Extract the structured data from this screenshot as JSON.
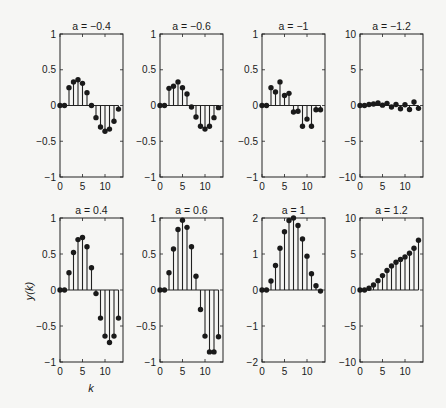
{
  "figure": {
    "ylabel": "y(k)",
    "xlabel": "k"
  },
  "chart_data": [
    {
      "type": "stem",
      "title": "a = −0.4",
      "row": 0,
      "col": 0,
      "xlim": [
        0,
        14
      ],
      "ylim": [
        -1,
        1
      ],
      "xticks": [
        0,
        5,
        10
      ],
      "yticks": [
        -1,
        -0.5,
        0,
        0.5,
        1
      ],
      "ytick_labels": [
        "−1",
        "−0.5",
        "0",
        "0.5",
        "1"
      ],
      "x": [
        0,
        1,
        2,
        3,
        4,
        5,
        6,
        7,
        8,
        9,
        10,
        11,
        12,
        13
      ],
      "values": [
        0,
        0,
        0.25,
        0.33,
        0.36,
        0.31,
        0.18,
        0,
        -0.17,
        -0.3,
        -0.36,
        -0.33,
        -0.22,
        -0.05
      ]
    },
    {
      "type": "stem",
      "title": "a = −0.6",
      "row": 0,
      "col": 1,
      "xlim": [
        0,
        14
      ],
      "ylim": [
        -1,
        1
      ],
      "xticks": [
        0,
        5,
        10
      ],
      "yticks": [
        -1,
        -0.5,
        0,
        0.5,
        1
      ],
      "ytick_labels": [
        "−1",
        "−0.5",
        "0",
        "0.5",
        "1"
      ],
      "x": [
        0,
        1,
        2,
        3,
        4,
        5,
        6,
        7,
        8,
        9,
        10,
        11,
        12,
        13
      ],
      "values": [
        0,
        0,
        0.24,
        0.27,
        0.33,
        0.25,
        0.16,
        -0.02,
        -0.16,
        -0.29,
        -0.33,
        -0.29,
        -0.17,
        -0.03
      ]
    },
    {
      "type": "stem",
      "title": "a = −1",
      "row": 0,
      "col": 2,
      "xlim": [
        0,
        14
      ],
      "ylim": [
        -1,
        1
      ],
      "xticks": [
        0,
        5,
        10
      ],
      "yticks": [
        -1,
        -0.5,
        0,
        0.5,
        1
      ],
      "ytick_labels": [
        "−1",
        "−0.5",
        "0",
        "0.5",
        "1"
      ],
      "x": [
        0,
        1,
        2,
        3,
        4,
        5,
        6,
        7,
        8,
        9,
        10,
        11,
        12,
        13
      ],
      "values": [
        0,
        0,
        0.25,
        0.19,
        0.33,
        0.14,
        0.17,
        -0.09,
        -0.08,
        -0.29,
        -0.19,
        -0.29,
        -0.06,
        -0.06
      ]
    },
    {
      "type": "stem",
      "title": "a = −1.2",
      "row": 0,
      "col": 3,
      "xlim": [
        0,
        14
      ],
      "ylim": [
        -10,
        10
      ],
      "xticks": [
        0,
        5,
        10
      ],
      "yticks": [
        -10,
        -5,
        0,
        5,
        10
      ],
      "ytick_labels": [
        "−10",
        "−5",
        "0",
        "5",
        "10"
      ],
      "x": [
        0,
        1,
        2,
        3,
        4,
        5,
        6,
        7,
        8,
        9,
        10,
        11,
        12,
        13
      ],
      "values": [
        0,
        0,
        0.15,
        0.2,
        0.35,
        0.05,
        0.3,
        -0.2,
        0.15,
        -0.45,
        0.1,
        -0.55,
        0.5,
        -0.4
      ]
    },
    {
      "type": "stem",
      "title": "a = 0.4",
      "row": 1,
      "col": 0,
      "xlim": [
        0,
        14
      ],
      "ylim": [
        -1,
        1
      ],
      "xticks": [
        0,
        5,
        10
      ],
      "yticks": [
        -1,
        -0.5,
        0,
        0.5,
        1
      ],
      "ytick_labels": [
        "−1",
        "−0.5",
        "0",
        "0.5",
        "1"
      ],
      "x": [
        0,
        1,
        2,
        3,
        4,
        5,
        6,
        7,
        8,
        9,
        10,
        11,
        12,
        13
      ],
      "values": [
        0,
        0,
        0.24,
        0.52,
        0.7,
        0.73,
        0.6,
        0.31,
        -0.05,
        -0.39,
        -0.64,
        -0.73,
        -0.64,
        -0.39
      ]
    },
    {
      "type": "stem",
      "title": "a = 0.6",
      "row": 1,
      "col": 1,
      "xlim": [
        0,
        14
      ],
      "ylim": [
        -1,
        1
      ],
      "xticks": [
        0,
        5,
        10
      ],
      "yticks": [
        -1,
        -0.5,
        0,
        0.5,
        1
      ],
      "ytick_labels": [
        "−1",
        "−0.5",
        "0",
        "0.5",
        "1"
      ],
      "x": [
        0,
        1,
        2,
        3,
        4,
        5,
        6,
        7,
        8,
        9,
        10,
        11,
        12,
        13
      ],
      "values": [
        0,
        0,
        0.24,
        0.57,
        0.84,
        0.97,
        0.87,
        0.6,
        0.19,
        -0.27,
        -0.64,
        -0.86,
        -0.86,
        -0.65
      ]
    },
    {
      "type": "stem",
      "title": "a = 1",
      "row": 1,
      "col": 2,
      "xlim": [
        0,
        14
      ],
      "ylim": [
        -2,
        2
      ],
      "xticks": [
        0,
        5,
        10
      ],
      "yticks": [
        -2,
        -1,
        0,
        1,
        2
      ],
      "ytick_labels": [
        "−2",
        "−1",
        "0",
        "1",
        "2"
      ],
      "x": [
        0,
        1,
        2,
        3,
        4,
        5,
        6,
        7,
        8,
        9,
        10,
        11,
        12,
        13
      ],
      "values": [
        0,
        0,
        0.25,
        0.68,
        1.16,
        1.62,
        1.93,
        2.0,
        1.79,
        1.42,
        0.94,
        0.45,
        0.12,
        -0.03
      ]
    },
    {
      "type": "stem",
      "title": "a = 1.2",
      "row": 1,
      "col": 3,
      "xlim": [
        0,
        14
      ],
      "ylim": [
        -10,
        10
      ],
      "xticks": [
        0,
        5,
        10
      ],
      "yticks": [
        -10,
        -5,
        0,
        5,
        10
      ],
      "ytick_labels": [
        "−10",
        "−5",
        "0",
        "5",
        "10"
      ],
      "x": [
        0,
        1,
        2,
        3,
        4,
        5,
        6,
        7,
        8,
        9,
        10,
        11,
        12,
        13
      ],
      "values": [
        0,
        0,
        0.25,
        0.7,
        1.3,
        2.0,
        2.7,
        3.35,
        3.85,
        4.25,
        4.6,
        5.1,
        5.8,
        6.9
      ]
    }
  ]
}
